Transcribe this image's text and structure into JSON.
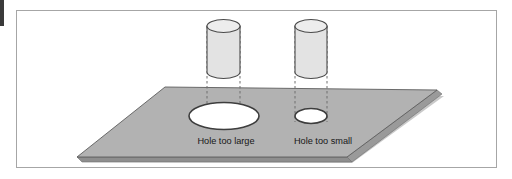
{
  "figure": {
    "title": "",
    "labels": [
      {
        "id": "hole-too-large",
        "text": "Hole too large",
        "x": 226,
        "y": 144
      },
      {
        "id": "hole-too-small",
        "text": "Hole too small",
        "x": 323,
        "y": 144
      }
    ],
    "objects": {
      "plate": {
        "name": "flat-plate",
        "description": "grey parallelogram plate shown in perspective with visible thickness"
      },
      "cylinders": [
        {
          "id": "left-cylinder",
          "name": "peg-over-large-hole"
        },
        {
          "id": "right-cylinder",
          "name": "peg-over-small-hole"
        }
      ],
      "holes": [
        {
          "id": "large-hole",
          "name": "oversized-hole"
        },
        {
          "id": "small-hole",
          "name": "undersized-hole"
        }
      ]
    },
    "colors": {
      "frame_border": "#a6a6a6",
      "plate_top": "#b2b2b2",
      "plate_edge": "#8e8e8e",
      "plate_shadow": "#c9c9c9",
      "cylinder_body": "#e3e3e3",
      "cylinder_top": "#ededed",
      "outline": "#4a4a4a",
      "hole_fill": "#ffffff",
      "dash_line": "#7a7a7a",
      "text": "#171717",
      "page_background": "#ffffff"
    }
  }
}
